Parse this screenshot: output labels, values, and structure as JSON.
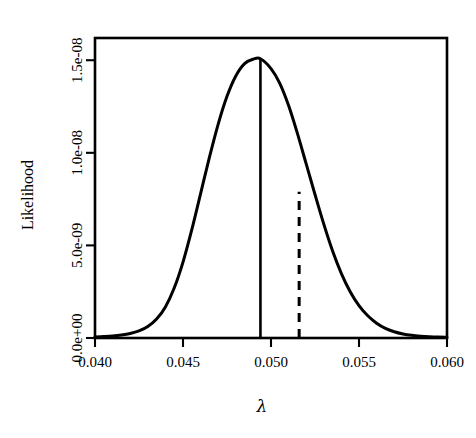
{
  "figure": {
    "width": 476,
    "height": 438,
    "background": "#ffffff",
    "foreground": "#000000"
  },
  "chart_data": {
    "type": "line",
    "title": "",
    "subtitle": "",
    "xlabel": "λ",
    "ylabel": "Likelihood",
    "grid": false,
    "legend": "none",
    "xlim": [
      0.04,
      0.06
    ],
    "ylim": [
      0.0,
      1.62e-08
    ],
    "xticks": [
      0.04,
      0.045,
      0.05,
      0.055,
      0.06
    ],
    "xticklabels": [
      "0.040",
      "0.045",
      "0.050",
      "0.055",
      "0.060"
    ],
    "yticks": [
      0.0,
      5e-09,
      1e-08,
      1.5e-08
    ],
    "yticklabels": [
      "0.0e+00",
      "5.0e-09",
      "1.0e-08",
      "1.5e-08"
    ],
    "series": [
      {
        "name": "Likelihood curve",
        "style": "solid",
        "x": [
          0.04,
          0.0405,
          0.041,
          0.0415,
          0.042,
          0.0425,
          0.043,
          0.0435,
          0.044,
          0.0445,
          0.045,
          0.0455,
          0.046,
          0.0465,
          0.047,
          0.0475,
          0.048,
          0.0485,
          0.049,
          0.0494,
          0.05,
          0.0505,
          0.051,
          0.0515,
          0.052,
          0.0525,
          0.053,
          0.0535,
          0.054,
          0.0545,
          0.055,
          0.0555,
          0.056,
          0.0565,
          0.057,
          0.0575,
          0.058,
          0.0585,
          0.059,
          0.0595,
          0.06
        ],
        "y": [
          6e-11,
          8e-11,
          1.1e-10,
          1.6e-10,
          2.4e-10,
          3.8e-10,
          6.2e-10,
          1.02e-09,
          1.68e-09,
          2.7e-09,
          4.1e-09,
          5.85e-09,
          7.8e-09,
          9.75e-09,
          1.155e-08,
          1.305e-08,
          1.415e-08,
          1.482e-08,
          1.506e-08,
          1.508e-08,
          1.455e-08,
          1.375e-08,
          1.255e-08,
          1.105e-08,
          9.4e-09,
          7.75e-09,
          6.15e-09,
          4.7e-09,
          3.48e-09,
          2.5e-09,
          1.75e-09,
          1.2e-09,
          8e-10,
          5.2e-10,
          3.4e-10,
          2.2e-10,
          1.45e-10,
          1e-10,
          7e-11,
          5e-11,
          4e-11
        ]
      }
    ],
    "annotations": [
      {
        "name": "mle-line",
        "kind": "vertical-line",
        "style": "solid",
        "x": 0.0494,
        "y_from": 0.0,
        "y_to": 1.508e-08,
        "label": ""
      },
      {
        "name": "reference-line",
        "kind": "vertical-line",
        "style": "dashed",
        "x": 0.0516,
        "y_from": 0.0,
        "y_to": 7.9e-09,
        "label": ""
      }
    ]
  },
  "axes": {
    "y_axis_title": "Likelihood",
    "x_axis_title": "λ"
  }
}
